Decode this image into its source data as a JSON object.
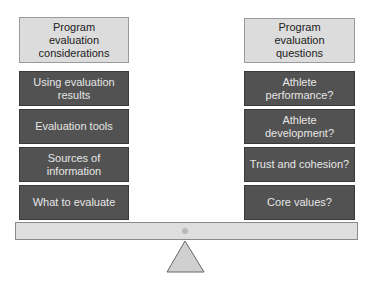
{
  "left_column": {
    "header": "Program evaluation considerations",
    "items": [
      {
        "label": "Using evaluation results"
      },
      {
        "label": "Evaluation tools"
      },
      {
        "label": "Sources of information"
      },
      {
        "label": "What to evaluate"
      }
    ]
  },
  "right_column": {
    "header": "Program evaluation questions",
    "items": [
      {
        "label": "Athlete performance?"
      },
      {
        "label": "Athlete development?"
      },
      {
        "label": "Trust and cohesion?"
      },
      {
        "label": "Core values?"
      }
    ]
  },
  "colors": {
    "header_fill": "#dcdcdc",
    "item_fill": "#525252",
    "item_text": "#e6e6e6",
    "beam_fill": "#dedede",
    "fulcrum_fill": "#d0d0d0"
  }
}
